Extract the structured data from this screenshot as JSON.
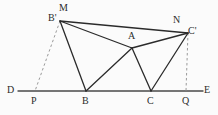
{
  "figure": {
    "background_color": "#fbfbfb",
    "stroke_color": "#2b2b2b",
    "dashed_color": "#8d8d8d",
    "canvas": {
      "width": 218,
      "height": 115
    }
  },
  "points": {
    "D": {
      "label": "D",
      "x": 18,
      "y": 91,
      "label_x": 7,
      "label_y": 85
    },
    "P": {
      "label": "P",
      "x": 35,
      "y": 91,
      "label_x": 31,
      "label_y": 96
    },
    "B": {
      "label": "B",
      "x": 86,
      "y": 91,
      "label_x": 82,
      "label_y": 96
    },
    "C": {
      "label": "C",
      "x": 151,
      "y": 91,
      "label_x": 147,
      "label_y": 96
    },
    "Q": {
      "label": "Q",
      "x": 186,
      "y": 91,
      "label_x": 182,
      "label_y": 96
    },
    "E": {
      "label": "E",
      "x": 203,
      "y": 91,
      "label_x": 204,
      "label_y": 85
    },
    "Bp": {
      "label": "B'",
      "x": 60,
      "y": 21,
      "label_x": 48,
      "label_y": 13
    },
    "M": {
      "label": "M",
      "x": 62,
      "y": 18,
      "label_x": 59,
      "label_y": 3
    },
    "A": {
      "label": "A",
      "x": 132,
      "y": 48,
      "label_x": 128,
      "label_y": 31
    },
    "N": {
      "label": "N",
      "x": 177,
      "y": 29,
      "label_x": 173,
      "label_y": 15
    },
    "Cp": {
      "label": "C'",
      "x": 188,
      "y": 33,
      "label_x": 188,
      "label_y": 26
    }
  },
  "edges": {
    "baseline": {
      "name": "D-E baseline",
      "style": "solid"
    },
    "solid": [
      {
        "name": "Bprime-to-Cprime",
        "from": "Bp",
        "to": "Cp"
      },
      {
        "name": "Bprime-to-A",
        "from": "Bp",
        "to": "A"
      },
      {
        "name": "Bprime-to-B",
        "from": "Bp",
        "to": "B"
      },
      {
        "name": "B-to-A",
        "from": "B",
        "to": "A"
      },
      {
        "name": "A-to-C",
        "from": "A",
        "to": "C"
      },
      {
        "name": "A-to-Cprime",
        "from": "A",
        "to": "Cp"
      },
      {
        "name": "C-to-Cprime",
        "from": "C",
        "to": "Cp"
      }
    ],
    "dashed": [
      {
        "name": "Bprime-to-P",
        "from": "Bp",
        "to": "P"
      },
      {
        "name": "Cprime-to-Q",
        "from": "Cp",
        "to": "Q"
      }
    ]
  }
}
